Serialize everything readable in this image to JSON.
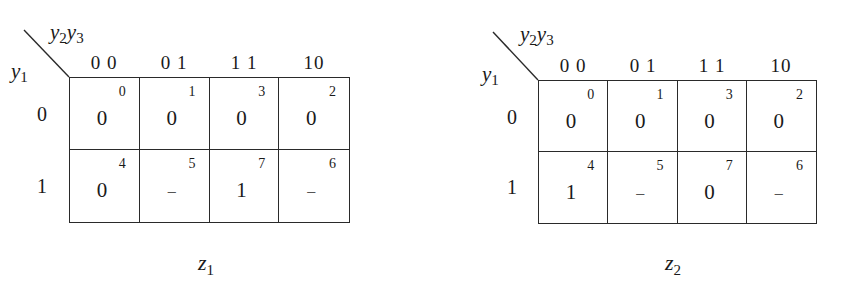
{
  "kmaps": [
    {
      "caption_var": "z",
      "caption_sub": "1",
      "row_var": "y",
      "row_var_sub": "1",
      "col_var1": "y",
      "col_var1_sub": "2",
      "col_var2": "y",
      "col_var2_sub": "3",
      "col_headers": [
        "0 0",
        "0 1",
        "1 1",
        "10"
      ],
      "row_headers": [
        "0",
        "1"
      ],
      "cells": [
        [
          {
            "value": "0",
            "index": "0"
          },
          {
            "value": "0",
            "index": "1"
          },
          {
            "value": "0",
            "index": "3"
          },
          {
            "value": "0",
            "index": "2"
          }
        ],
        [
          {
            "value": "0",
            "index": "4"
          },
          {
            "value": "–",
            "index": "5"
          },
          {
            "value": "1",
            "index": "7"
          },
          {
            "value": "–",
            "index": "6"
          }
        ]
      ]
    },
    {
      "caption_var": "z",
      "caption_sub": "2",
      "row_var": "y",
      "row_var_sub": "1",
      "col_var1": "y",
      "col_var1_sub": "2",
      "col_var2": "y",
      "col_var2_sub": "3",
      "col_headers": [
        "0 0",
        "0 1",
        "1 1",
        "10"
      ],
      "row_headers": [
        "0",
        "1"
      ],
      "cells": [
        [
          {
            "value": "0",
            "index": "0"
          },
          {
            "value": "0",
            "index": "1"
          },
          {
            "value": "0",
            "index": "3"
          },
          {
            "value": "0",
            "index": "2"
          }
        ],
        [
          {
            "value": "1",
            "index": "4"
          },
          {
            "value": "–",
            "index": "5"
          },
          {
            "value": "0",
            "index": "7"
          },
          {
            "value": "–",
            "index": "6"
          }
        ]
      ]
    }
  ],
  "colors": {
    "line": "#2a2a2a",
    "text": "#1a1a1a",
    "dont_care": "#555555"
  }
}
